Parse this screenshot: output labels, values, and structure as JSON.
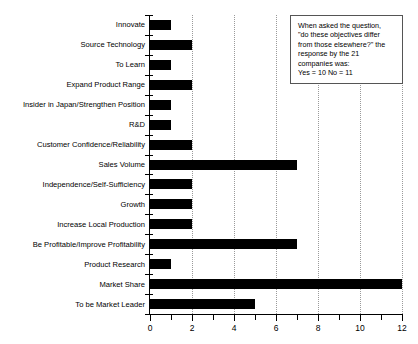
{
  "chart_data": {
    "type": "bar",
    "orientation": "horizontal",
    "title": "",
    "xlabel": "",
    "ylabel": "",
    "xlim": [
      0,
      12
    ],
    "grid": true,
    "gridlines": [
      2,
      4,
      6,
      8,
      10,
      12
    ],
    "legend": "none",
    "xticks_major": [
      0,
      2,
      4,
      6,
      8,
      10,
      12
    ],
    "xticks_minor": [
      1,
      3,
      5,
      7,
      9,
      11
    ],
    "xtick_labels": [
      "0",
      "2",
      "4",
      "6",
      "8",
      "10",
      "12"
    ],
    "categories": [
      "Innovate",
      "Source Technology",
      "To Learn",
      "Expand Product Range",
      "Insider in Japan/Strengthen Position",
      "R&D",
      "Customer Confidence/Reliability",
      "Sales Volume",
      "Independence/Self-Sufficiency",
      "Growth",
      "Increase Local Production",
      "Be Profitable/Improve Profitability",
      "Product Research",
      "Market Share",
      "To be Market Leader"
    ],
    "values": [
      1,
      2,
      1,
      2,
      1,
      1,
      2,
      7,
      2,
      2,
      2,
      7,
      1,
      12,
      5
    ]
  },
  "annotation": {
    "name": "question-response-note",
    "lines": [
      "When asked the question,",
      "\"do these objectives differ",
      "from those elsewhere?\" the",
      "response by the 21",
      "companies was:",
      "Yes = 10 No = 11"
    ],
    "border_color": "#555555",
    "background_color": "#ffffff"
  },
  "style": {
    "bar_color": "#000000",
    "axis_color": "#000000",
    "gridline_color": "#9a9a9a",
    "background": "#ffffff"
  }
}
